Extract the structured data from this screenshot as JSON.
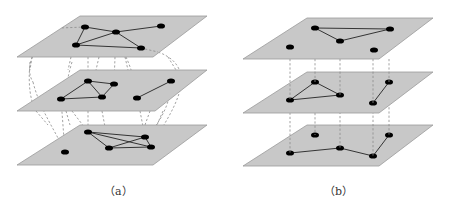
{
  "figures": [
    {
      "id": "a",
      "caption": "（a）",
      "layers": [
        {
          "name": "top",
          "corners": [
            [
              80,
              16
            ],
            [
              207,
              16
            ],
            [
              153,
              57
            ],
            [
              17,
              57
            ]
          ],
          "nodes": [
            [
              85,
              27
            ],
            [
              116,
              32
            ],
            [
              161,
              26
            ],
            [
              76,
              45
            ],
            [
              141,
              48
            ]
          ],
          "edges": [
            [
              0,
              1
            ],
            [
              1,
              2
            ],
            [
              0,
              3
            ],
            [
              3,
              1
            ],
            [
              1,
              4
            ],
            [
              3,
              4
            ]
          ]
        },
        {
          "name": "middle",
          "corners": [
            [
              80,
              70
            ],
            [
              207,
              70
            ],
            [
              155,
              111
            ],
            [
              17,
              111
            ]
          ],
          "nodes": [
            [
              88,
              81
            ],
            [
              114,
              84
            ],
            [
              61,
              99
            ],
            [
              102,
              97
            ],
            [
              137,
              98
            ],
            [
              171,
              81
            ]
          ],
          "edges": [
            [
              0,
              1
            ],
            [
              0,
              2
            ],
            [
              0,
              3
            ],
            [
              1,
              3
            ],
            [
              2,
              3
            ],
            [
              4,
              5
            ]
          ]
        },
        {
          "name": "bottom",
          "corners": [
            [
              80,
              125
            ],
            [
              207,
              125
            ],
            [
              153,
              165
            ],
            [
              17,
              165
            ]
          ],
          "nodes": [
            [
              88,
              132
            ],
            [
              145,
              137
            ],
            [
              109,
              148
            ],
            [
              151,
              147
            ],
            [
              65,
              152
            ]
          ],
          "edges": [
            [
              0,
              1
            ],
            [
              0,
              2
            ],
            [
              0,
              3
            ],
            [
              1,
              2
            ],
            [
              2,
              3
            ],
            [
              1,
              3
            ]
          ]
        }
      ]
    },
    {
      "id": "b",
      "caption": "（b）",
      "layers": [
        {
          "name": "top",
          "corners": [
            [
              307,
              18
            ],
            [
              433,
              18
            ],
            [
              379,
              59
            ],
            [
              243,
              59
            ]
          ],
          "nodes": [
            [
              315,
              28
            ],
            [
              390,
              29
            ],
            [
              340,
              41
            ],
            [
              290,
              47
            ],
            [
              374,
              50
            ]
          ],
          "edges": [
            [
              0,
              1
            ],
            [
              1,
              2
            ],
            [
              0,
              2
            ]
          ]
        },
        {
          "name": "middle",
          "corners": [
            [
              307,
              72
            ],
            [
              433,
              72
            ],
            [
              379,
              113
            ],
            [
              243,
              113
            ]
          ],
          "nodes": [
            [
              315,
              82
            ],
            [
              290,
              100
            ],
            [
              340,
              95
            ],
            [
              389,
              82
            ],
            [
              373,
              103
            ]
          ],
          "edges": [
            [
              0,
              1
            ],
            [
              1,
              2
            ],
            [
              0,
              2
            ],
            [
              3,
              4
            ]
          ]
        },
        {
          "name": "bottom",
          "corners": [
            [
              307,
              125
            ],
            [
              433,
              125
            ],
            [
              379,
              166
            ],
            [
              243,
              166
            ]
          ],
          "nodes": [
            [
              315,
              135
            ],
            [
              389,
              135
            ],
            [
              340,
              148
            ],
            [
              290,
              153
            ],
            [
              373,
              156
            ]
          ],
          "edges": [
            [
              3,
              2
            ],
            [
              2,
              4
            ],
            [
              4,
              1
            ]
          ]
        }
      ]
    }
  ],
  "captions": {
    "a": "（a）",
    "b": "（b）"
  }
}
